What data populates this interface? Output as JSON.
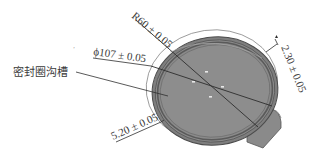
{
  "diagram": {
    "type": "engineering-drawing",
    "colors": {
      "background": "#ffffff",
      "part_fill": "#8c8c8c",
      "part_rim": "#6e6e6e",
      "groove": "#5a5a5a",
      "lines": "#2e2e2e",
      "text": "#3a3a3a"
    },
    "labels": {
      "groove_label": "密封圈沟槽"
    },
    "dimensions": {
      "radius": "R60 ± 0.05",
      "diameter": "ϕ107 ± 0.05",
      "width_2_30": "2.30 ± 0.05",
      "depth_5_20": "5.20 ± 0.05"
    },
    "stray_mark": "ʼ"
  }
}
